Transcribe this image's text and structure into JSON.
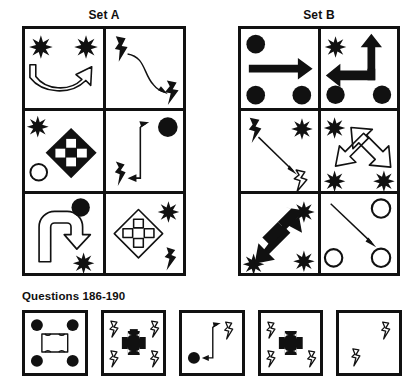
{
  "sets": {
    "a": {
      "title": "Set A",
      "cells": [
        {
          "name": "set-a-cell-1",
          "description": "open U-shaped curved arrow pointing up-right with two black 8-point stars at top corners",
          "shapes": [
            "star-black",
            "star-black",
            "arrow-curved-outline-u"
          ]
        },
        {
          "name": "set-a-cell-2",
          "description": "black lightning bolt top-left, thin curved arrow to black lightning bolt bottom-right",
          "shapes": [
            "lightning-black",
            "arrow-curved-thin",
            "lightning-black"
          ]
        },
        {
          "name": "set-a-cell-3",
          "description": "black four-way diamond arrow centered, black star top-left, open circle bottom-left",
          "shapes": [
            "star-black",
            "circle-outline",
            "diamond-arrow-black"
          ]
        },
        {
          "name": "set-a-cell-4",
          "description": "thin bent arrow up-right and left, black filled circle top-right, black lightning bolt bottom-left",
          "shapes": [
            "circle-black",
            "lightning-black",
            "arrow-bent-thin"
          ]
        },
        {
          "name": "set-a-cell-5",
          "description": "outline hook arrow curving right-down, black filled circle top-right, black star bottom-right",
          "shapes": [
            "circle-black",
            "star-black",
            "arrow-hook-outline"
          ]
        },
        {
          "name": "set-a-cell-6",
          "description": "outline four-way diamond arrow centered, black star top-right, black lightning bolt bottom-right",
          "shapes": [
            "star-black",
            "lightning-black",
            "diamond-arrow-outline"
          ]
        }
      ]
    },
    "b": {
      "title": "Set B",
      "cells": [
        {
          "name": "set-b-cell-1",
          "description": "thick black straight arrow pointing right, three black filled circles at corners",
          "shapes": [
            "circle-black",
            "circle-black",
            "circle-black",
            "arrow-straight-black-right"
          ]
        },
        {
          "name": "set-b-cell-2",
          "description": "thick black bent arrow pointing up and left, black star top-left, two black circles at bottom",
          "shapes": [
            "star-black",
            "circle-black",
            "circle-black",
            "arrow-bent-black-up-left"
          ]
        },
        {
          "name": "set-b-cell-3",
          "description": "black lightning bolt top-left, thin diagonal arrow down-right to outline lightning bolt",
          "shapes": [
            "lightning-black",
            "arrow-diagonal-thin",
            "lightning-outline"
          ]
        },
        {
          "name": "set-b-cell-4",
          "description": "outline double-headed diagonal arrow, three black stars at corners",
          "shapes": [
            "star-black",
            "star-black",
            "star-black",
            "arrow-double-diagonal-outline"
          ]
        },
        {
          "name": "set-b-cell-5",
          "description": "black double-headed diagonal arrow, three black stars at corners",
          "shapes": [
            "star-black",
            "star-black",
            "star-black",
            "arrow-double-diagonal-black"
          ]
        },
        {
          "name": "set-b-cell-6",
          "description": "thin diagonal arrow down-right, three open outline circles at corners",
          "shapes": [
            "circle-outline",
            "circle-outline",
            "circle-outline",
            "arrow-diagonal-thin"
          ]
        }
      ]
    }
  },
  "questions": {
    "label": "Questions 186-190",
    "options": [
      {
        "name": "option-1",
        "description": "outline rounded square with four black circles at corners",
        "shapes": [
          "circle-black",
          "circle-black",
          "circle-black",
          "circle-black",
          "square-notched-outline"
        ]
      },
      {
        "name": "option-2",
        "description": "black notched cross/plus shape with four outline lightning bolts at corners",
        "shapes": [
          "lightning-outline",
          "lightning-outline",
          "lightning-outline",
          "lightning-outline",
          "cross-notched-black"
        ]
      },
      {
        "name": "option-3",
        "description": "thin bent arrow up-right and left, black circle bottom-left, outline lightning bolt top-right",
        "shapes": [
          "circle-black",
          "lightning-outline",
          "arrow-bent-thin"
        ]
      },
      {
        "name": "option-4",
        "description": "black notched cross/plus shape with three outline lightning bolts",
        "shapes": [
          "lightning-outline",
          "lightning-outline",
          "lightning-outline",
          "cross-notched-black"
        ]
      },
      {
        "name": "option-5",
        "description": "empty box with two outline lightning bolts",
        "shapes": [
          "lightning-outline",
          "lightning-outline"
        ]
      }
    ]
  },
  "colors": {
    "ink": "#111111",
    "paper": "#ffffff",
    "text": "#100f0f"
  }
}
